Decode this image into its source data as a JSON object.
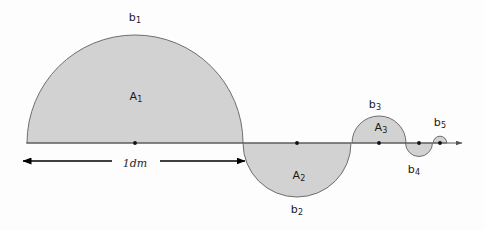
{
  "figure": {
    "background_color": "#fdfdfd",
    "fill_color": "#d2d2d2",
    "stroke_color": "#6e6e6e",
    "axis_color": "#555555",
    "dot_color": "#111111",
    "arrow_color": "#000000",
    "baseline_y": 143,
    "axis_start_x": 26,
    "axis_end_x": 462
  },
  "chart_data": {
    "type": "diagram",
    "xlabel": "",
    "ylabel": "",
    "grid": false,
    "legend": "none",
    "baseline_y": 143,
    "semicircles": [
      {
        "name": "A1",
        "arc_label": "b1",
        "area_label": "A1",
        "center_x": 135,
        "radius": 108,
        "side": "up",
        "area_label_x": 136,
        "area_label_y": 97,
        "arc_label_x": 135,
        "arc_label_y": 18
      },
      {
        "name": "A2",
        "arc_label": "b2",
        "area_label": "A2",
        "center_x": 297,
        "radius": 54,
        "side": "down",
        "area_label_x": 299,
        "area_label_y": 176,
        "arc_label_x": 297,
        "arc_label_y": 210
      },
      {
        "name": "A3",
        "arc_label": "b3",
        "area_label": "A3",
        "center_x": 379,
        "radius": 27,
        "side": "up",
        "area_label_x": 381,
        "area_label_y": 128,
        "arc_label_x": 375,
        "arc_label_y": 105
      },
      {
        "name": "A4",
        "arc_label": "b4",
        "area_label": "",
        "center_x": 419,
        "radius": 13.5,
        "side": "down",
        "area_label_x": 0,
        "area_label_y": 0,
        "arc_label_x": 414,
        "arc_label_y": 170
      },
      {
        "name": "A5",
        "arc_label": "b5",
        "area_label": "",
        "center_x": 440,
        "radius": 6.8,
        "side": "up",
        "area_label_x": 0,
        "area_label_y": 0,
        "arc_label_x": 440,
        "arc_label_y": 123
      }
    ],
    "center_dots": [
      {
        "x": 135,
        "y": 143
      },
      {
        "x": 297,
        "y": 143
      },
      {
        "x": 379,
        "y": 143
      },
      {
        "x": 419,
        "y": 143
      },
      {
        "x": 440,
        "y": 143
      }
    ],
    "dimension": {
      "label": "1dm",
      "label_x": 135,
      "label_y": 163,
      "left_x": 23,
      "right_x": 245,
      "y": 161,
      "gap_left": 112,
      "gap_right": 160
    }
  },
  "labels": {
    "b1": "b",
    "b1_sub": "1",
    "b2": "b",
    "b2_sub": "2",
    "b3": "b",
    "b3_sub": "3",
    "b4": "b",
    "b4_sub": "4",
    "b5": "b",
    "b5_sub": "5",
    "a1": "A",
    "a1_sub": "1",
    "a2": "A",
    "a2_sub": "2",
    "a3": "A",
    "a3_sub": "3",
    "unit": "1dm"
  }
}
